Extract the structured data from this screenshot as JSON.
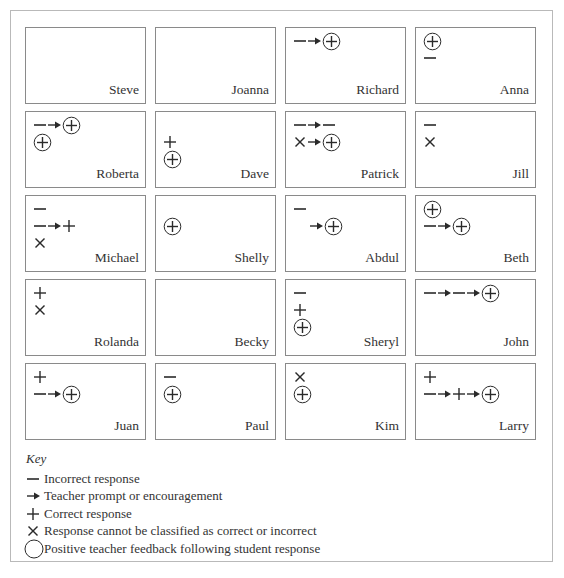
{
  "figure": {
    "grid_columns": 4,
    "grid_rows": 5,
    "cells": [
      {
        "name": "Steve",
        "lines": []
      },
      {
        "name": "Joanna",
        "lines": []
      },
      {
        "name": "Richard",
        "lines": [
          {
            "indent": 0,
            "tokens": [
              "incorrect",
              "prompt",
              "feedback"
            ]
          }
        ]
      },
      {
        "name": "Anna",
        "lines": [
          {
            "indent": 0,
            "tokens": [
              "feedback"
            ]
          },
          {
            "indent": 0,
            "tokens": [
              "incorrect"
            ]
          }
        ]
      },
      {
        "name": "Roberta",
        "lines": [
          {
            "indent": 0,
            "tokens": [
              "incorrect",
              "prompt",
              "feedback"
            ]
          },
          {
            "indent": 0,
            "tokens": [
              "feedback"
            ]
          }
        ]
      },
      {
        "name": "Dave",
        "lines": [
          {
            "indent": 0,
            "tokens": []
          },
          {
            "indent": 0,
            "tokens": [
              "correct"
            ]
          },
          {
            "indent": 0,
            "tokens": [
              "feedback"
            ]
          }
        ]
      },
      {
        "name": "Patrick",
        "lines": [
          {
            "indent": 0,
            "tokens": [
              "incorrect",
              "prompt",
              "incorrect"
            ]
          },
          {
            "indent": 0,
            "tokens": [
              "unclassified",
              "prompt",
              "feedback"
            ]
          }
        ]
      },
      {
        "name": "Jill",
        "lines": [
          {
            "indent": 0,
            "tokens": [
              "incorrect"
            ]
          },
          {
            "indent": 0,
            "tokens": [
              "unclassified"
            ]
          }
        ]
      },
      {
        "name": "Michael",
        "lines": [
          {
            "indent": 0,
            "tokens": [
              "incorrect"
            ]
          },
          {
            "indent": 0,
            "tokens": [
              "incorrect",
              "prompt",
              "correct"
            ]
          },
          {
            "indent": 0,
            "tokens": [
              "unclassified"
            ]
          }
        ]
      },
      {
        "name": "Shelly",
        "lines": [
          {
            "indent": 0,
            "tokens": []
          },
          {
            "indent": 0,
            "tokens": [
              "feedback"
            ]
          }
        ]
      },
      {
        "name": "Abdul",
        "lines": [
          {
            "indent": 0,
            "tokens": [
              "incorrect"
            ]
          },
          {
            "indent": 1,
            "tokens": [
              "prompt",
              "feedback"
            ]
          }
        ]
      },
      {
        "name": "Beth",
        "lines": [
          {
            "indent": 0,
            "tokens": [
              "feedback"
            ]
          },
          {
            "indent": 0,
            "tokens": [
              "incorrect",
              "prompt",
              "feedback"
            ]
          }
        ]
      },
      {
        "name": "Rolanda",
        "lines": [
          {
            "indent": 0,
            "tokens": [
              "correct"
            ]
          },
          {
            "indent": 0,
            "tokens": [
              "unclassified"
            ]
          }
        ]
      },
      {
        "name": "Becky",
        "lines": []
      },
      {
        "name": "Sheryl",
        "lines": [
          {
            "indent": 0,
            "tokens": [
              "incorrect"
            ]
          },
          {
            "indent": 0,
            "tokens": [
              "correct"
            ]
          },
          {
            "indent": 0,
            "tokens": [
              "feedback"
            ]
          }
        ]
      },
      {
        "name": "John",
        "lines": [
          {
            "indent": 0,
            "tokens": [
              "incorrect",
              "prompt",
              "incorrect",
              "prompt",
              "feedback"
            ]
          }
        ]
      },
      {
        "name": "Juan",
        "lines": [
          {
            "indent": 0,
            "tokens": [
              "correct"
            ]
          },
          {
            "indent": 0,
            "tokens": [
              "incorrect",
              "prompt",
              "feedback"
            ]
          }
        ]
      },
      {
        "name": "Paul",
        "lines": [
          {
            "indent": 0,
            "tokens": [
              "incorrect"
            ]
          },
          {
            "indent": 0,
            "tokens": [
              "feedback"
            ]
          }
        ]
      },
      {
        "name": "Kim",
        "lines": [
          {
            "indent": 0,
            "tokens": [
              "unclassified"
            ]
          },
          {
            "indent": 0,
            "tokens": [
              "feedback"
            ]
          }
        ]
      },
      {
        "name": "Larry",
        "lines": [
          {
            "indent": 0,
            "tokens": [
              "correct"
            ]
          },
          {
            "indent": 0,
            "tokens": [
              "incorrect",
              "prompt",
              "correct",
              "prompt",
              "feedback"
            ]
          }
        ]
      }
    ]
  },
  "key": {
    "title": "Key",
    "items": [
      {
        "symbol": "incorrect",
        "icon": "dash-icon",
        "label": "Incorrect response"
      },
      {
        "symbol": "prompt",
        "icon": "arrow-right-icon",
        "label": "Teacher prompt or encouragement"
      },
      {
        "symbol": "correct",
        "icon": "plus-icon",
        "label": "Correct response"
      },
      {
        "symbol": "unclassified",
        "icon": "x-icon",
        "label": "Response cannot be classified as correct or incorrect"
      },
      {
        "symbol": "circle",
        "icon": "circle-icon",
        "label": "Positive teacher feedback following student response"
      }
    ]
  },
  "colors": {
    "ink": "#2a2a2a",
    "cell_border": "#8a8a8a",
    "frame_border": "#b9b9b9"
  }
}
